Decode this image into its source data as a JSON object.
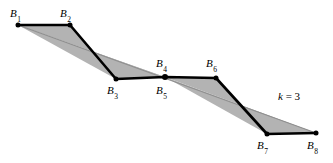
{
  "figure": {
    "background_color": "#ffffff",
    "band_fill_color": "#b3b3b3",
    "band_edge_color": "#8c8c8c",
    "polyline_color": "#000000",
    "vertex_dot_color": "#000000",
    "width": 333,
    "height": 163
  },
  "annotation": {
    "k_prefix": "k",
    "k_equals": " = ",
    "k_value": "3",
    "k_text": "k = 3",
    "x": 278,
    "y": 91
  },
  "vertices": [
    {
      "id": "B1",
      "label": "B",
      "subscript": "1",
      "x": 18,
      "y": 25,
      "label_x": 10,
      "label_y": 8,
      "label_pos": "above-left"
    },
    {
      "id": "B2",
      "label": "B",
      "subscript": "2",
      "x": 70,
      "y": 25,
      "label_x": 60,
      "label_y": 8,
      "label_pos": "above-left"
    },
    {
      "id": "B3",
      "label": "B",
      "subscript": "3",
      "x": 116,
      "y": 79,
      "label_x": 107,
      "label_y": 85,
      "label_pos": "below-left"
    },
    {
      "id": "B4",
      "label": "B",
      "subscript": "4",
      "x": 165,
      "y": 77,
      "label_x": 156,
      "label_y": 60,
      "label_pos": "above"
    },
    {
      "id": "B5",
      "label": "B",
      "subscript": "5",
      "x": 165,
      "y": 77,
      "label_x": 156,
      "label_y": 85,
      "label_pos": "below"
    },
    {
      "id": "B6",
      "label": "B",
      "subscript": "6",
      "x": 216,
      "y": 78,
      "label_x": 206,
      "label_y": 60,
      "label_pos": "above"
    },
    {
      "id": "B7",
      "label": "B",
      "subscript": "7",
      "x": 267,
      "y": 134,
      "label_x": 257,
      "label_y": 140,
      "label_pos": "below-left"
    },
    {
      "id": "B8",
      "label": "B",
      "subscript": "8",
      "x": 316,
      "y": 133,
      "label_x": 307,
      "label_y": 140,
      "label_pos": "below-right"
    }
  ],
  "geometry": {
    "polyline_points": "18,25 70,25 116,79 165,77 216,78 267,134 316,133",
    "chord_points": "18,25 316,133",
    "band_upper_polygon": "18,25 70,25 116,79 165,77 216,78 267,134 316,133",
    "band_lower_polygon": "18,25 316,133",
    "shaded_regions": [
      {
        "name": "upper-lens",
        "points": "18,25 70,25 116,79 165,77"
      },
      {
        "name": "lower-lens",
        "points": "165,77 216,78 267,134 316,133"
      }
    ]
  }
}
